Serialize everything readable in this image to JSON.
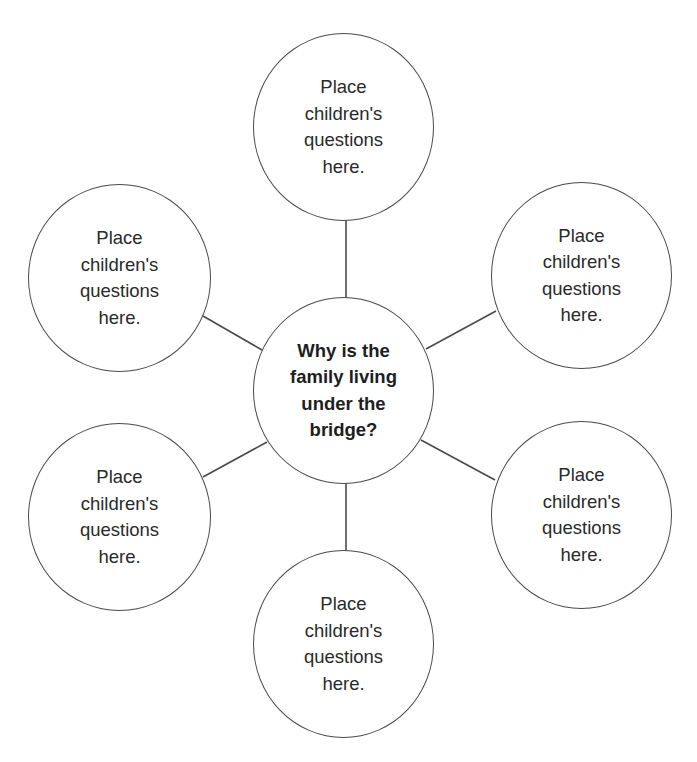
{
  "diagram": {
    "type": "question web",
    "center": {
      "label": "Why is the\nfamily living\nunder the\nbridge?"
    },
    "satellites": [
      {
        "position": "top",
        "label": "Place\nchildren's\nquestions\nhere."
      },
      {
        "position": "upper-left",
        "label": "Place\nchildren's\nquestions\nhere."
      },
      {
        "position": "upper-right",
        "label": "Place\nchildren's\nquestions\nhere."
      },
      {
        "position": "lower-left",
        "label": "Place\nchildren's\nquestions\nhere."
      },
      {
        "position": "lower-right",
        "label": "Place\nchildren's\nquestions\nhere."
      },
      {
        "position": "bottom",
        "label": "Place\nchildren's\nquestions\nhere."
      }
    ],
    "colors": {
      "stroke": "#4a4a4a",
      "text": "#2a2a2a",
      "background": "#ffffff"
    }
  }
}
